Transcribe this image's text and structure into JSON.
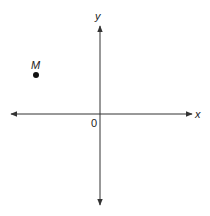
{
  "diagram": {
    "type": "coordinate-plane",
    "axes": {
      "x_label": "x",
      "y_label": "y",
      "origin_label": "0"
    },
    "points": [
      {
        "label": "M",
        "quadrant": "II"
      }
    ],
    "colors": {
      "axis": "#333333",
      "point": "#111111",
      "text": "#222222",
      "background": "#ffffff"
    }
  }
}
